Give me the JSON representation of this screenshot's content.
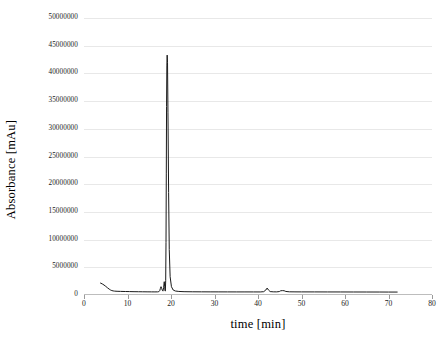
{
  "chart_data": {
    "type": "line",
    "title": "",
    "subtitle": "",
    "xlabel": "time [min]",
    "ylabel": "Absorbance [mAu]",
    "xlim": [
      0,
      80
    ],
    "ylim": [
      0,
      50000000
    ],
    "grid": true,
    "legend": false,
    "legend_position": "none",
    "line_color": "#1a1a1a",
    "gridline_color": "#e8e8e8",
    "background_color": "#ffffff",
    "x_ticks": [
      0,
      10,
      20,
      30,
      40,
      50,
      60,
      70,
      80
    ],
    "x_tick_labels": [
      "0",
      "10",
      "20",
      "30",
      "40",
      "50",
      "60",
      "70",
      "80"
    ],
    "y_ticks": [
      0,
      5000000,
      10000000,
      15000000,
      20000000,
      25000000,
      30000000,
      35000000,
      40000000,
      45000000,
      50000000
    ],
    "y_tick_labels": [
      "0",
      "5000000",
      "10000000",
      "15000000",
      "20000000",
      "25000000",
      "30000000",
      "35000000",
      "40000000",
      "45000000",
      "50000000"
    ],
    "series": [
      {
        "name": "chromatogram",
        "x": [
          3.8,
          4.2,
          4.6,
          5.0,
          5.4,
          5.8,
          6.1,
          6.4,
          6.7,
          7.0,
          7.6,
          8.4,
          9.5,
          10.5,
          11.5,
          12.5,
          13.5,
          14.5,
          15.5,
          16.3,
          16.9,
          17.2,
          17.4,
          17.55,
          17.7,
          17.85,
          18.0,
          18.15,
          18.3,
          18.45,
          18.55,
          18.62,
          18.7,
          18.78,
          18.85,
          18.92,
          18.98,
          19.05,
          19.12,
          19.2,
          19.3,
          19.45,
          19.6,
          19.8,
          20.1,
          20.5,
          21.0,
          21.8,
          23.0,
          25.0,
          27.0,
          29.0,
          31.0,
          33.0,
          35.0,
          37.0,
          39.0,
          40.5,
          41.3,
          41.8,
          42.1,
          42.4,
          42.8,
          43.5,
          44.3,
          44.9,
          45.2,
          45.6,
          46.0,
          46.4,
          47.2,
          48.5,
          50.0,
          53.0,
          56.0,
          59.0,
          62.0,
          65.0,
          68.0,
          70.0,
          72.0
        ],
        "y": [
          2150000,
          2000000,
          1800000,
          1560000,
          1300000,
          1060000,
          900000,
          800000,
          740000,
          700000,
          670000,
          650000,
          630000,
          615000,
          600000,
          590000,
          580000,
          572000,
          565000,
          560000,
          565000,
          600000,
          760000,
          1150000,
          1500000,
          1200000,
          860000,
          700000,
          1320000,
          2400000,
          1500000,
          820000,
          700000,
          2600000,
          9500000,
          22000000,
          34000000,
          41500000,
          43300000,
          42000000,
          33000000,
          18500000,
          8200000,
          3300000,
          1500000,
          900000,
          720000,
          640000,
          600000,
          580000,
          570000,
          565000,
          562000,
          560000,
          558000,
          556000,
          554000,
          553000,
          600000,
          900000,
          1250000,
          900000,
          620000,
          570000,
          565000,
          620000,
          760000,
          790000,
          770000,
          640000,
          575000,
          565000,
          560000,
          556000,
          552000,
          548000,
          544000,
          540000,
          536000,
          532000,
          528000
        ]
      }
    ],
    "annotations": [
      {
        "label": "main-peak",
        "x": 19.12,
        "y": 43300000,
        "description": "dominant narrow peak at approximately 19 min reaching about 43.3 million mAu"
      },
      {
        "label": "solvent-front-decay",
        "x": 4.0,
        "y": 2150000,
        "description": "initial baseline decay from about 2.1 million mAu settling near zero by 7 min"
      },
      {
        "label": "minor-peaks-pre-main",
        "x": 18.3,
        "y": 2400000,
        "description": "small shoulder peaks just before the main peak between 17.5 and 18.5 min"
      },
      {
        "label": "minor-peaks-late",
        "x": 42.1,
        "y": 1250000,
        "description": "small late-eluting peaks near 42 min and 45 min"
      }
    ]
  }
}
